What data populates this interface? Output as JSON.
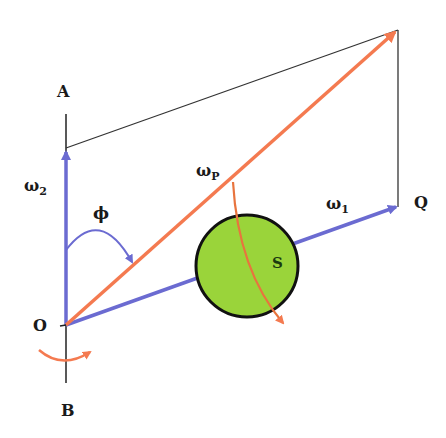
{
  "diagram": {
    "type": "angular-velocity-vector-diagram",
    "points": {
      "A": "A",
      "B": "B",
      "O": "O",
      "Q": "Q",
      "S": "S"
    },
    "vectors": {
      "omega_2": {
        "symbol": "ω",
        "subscript": "2",
        "color": "#6b6bd1"
      },
      "omega_1": {
        "symbol": "ω",
        "subscript": "1",
        "color": "#6b6bd1"
      },
      "omega_p": {
        "symbol": "ω",
        "subscript": "P",
        "color": "#f47a50"
      }
    },
    "angle": {
      "symbol": "ϕ"
    },
    "colors": {
      "blue_vector": "#6b6bd1",
      "orange_vector": "#f47a50",
      "sphere_fill": "#9ad43a",
      "outline": "#111111",
      "construction_line": "#333333"
    }
  }
}
